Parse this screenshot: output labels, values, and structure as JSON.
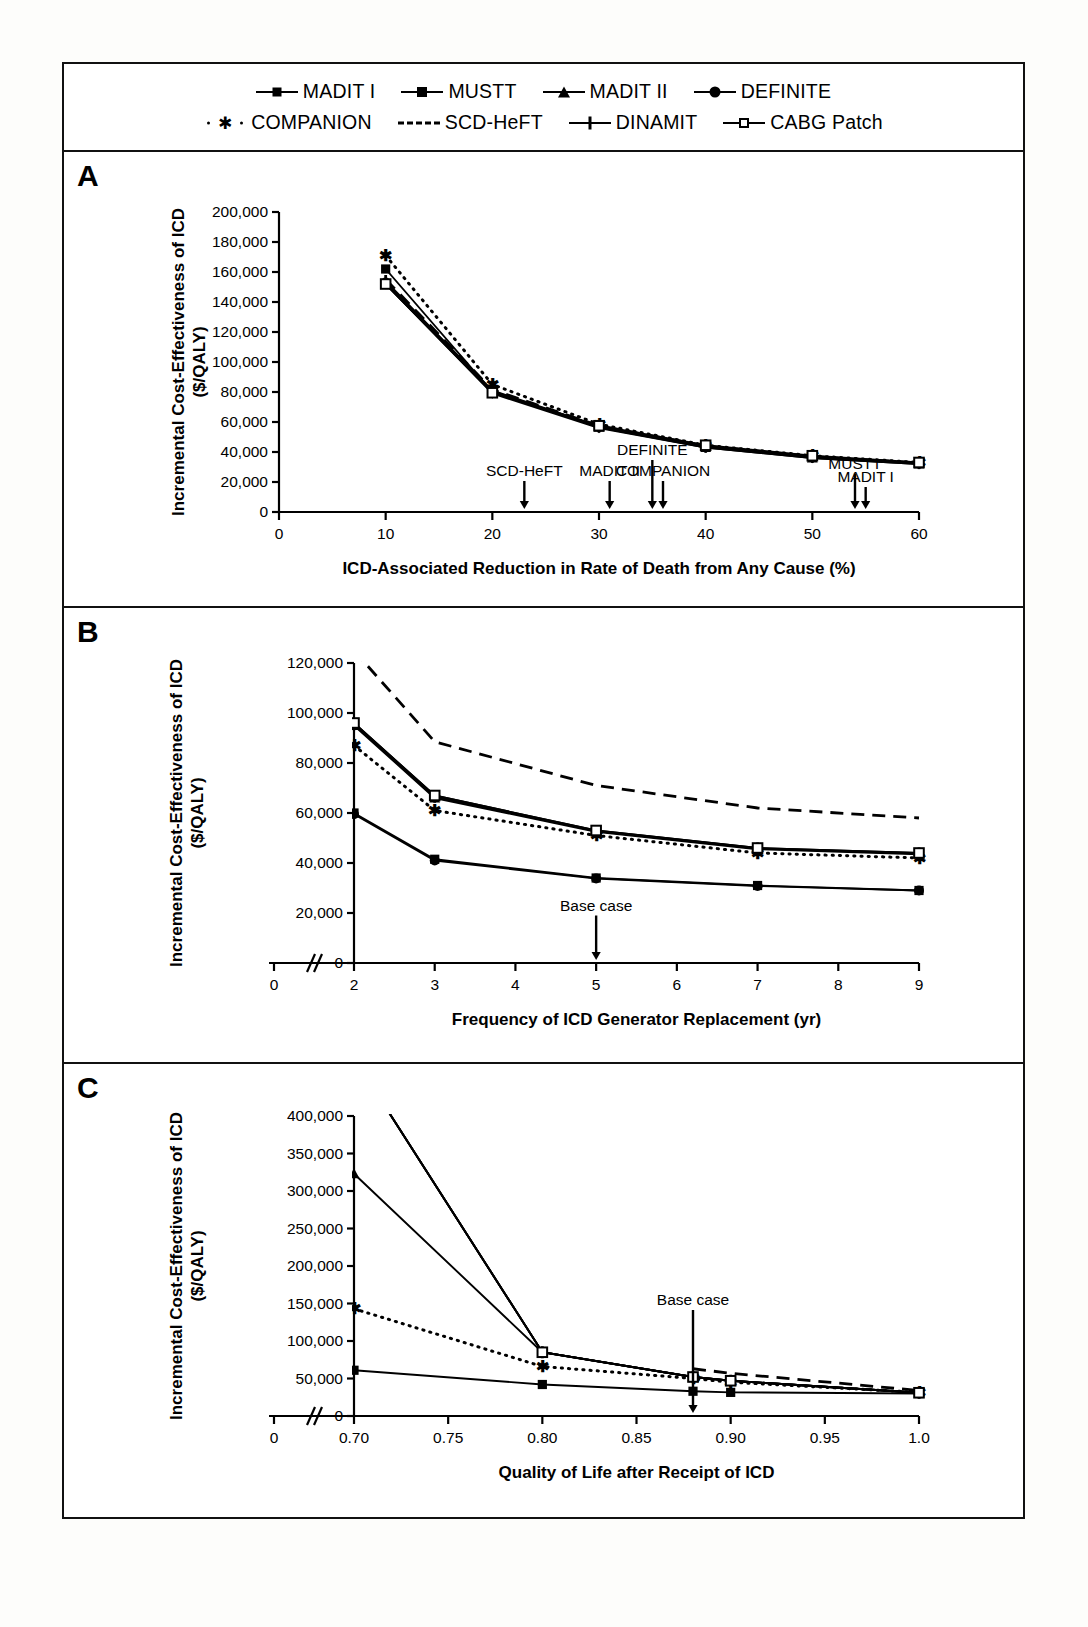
{
  "legend": {
    "rows": [
      [
        {
          "label": "MADIT I",
          "marker": "diamond",
          "line": "solid"
        },
        {
          "label": "MUSTT",
          "marker": "square",
          "line": "solid"
        },
        {
          "label": "MADIT II",
          "marker": "triangle",
          "line": "solid"
        },
        {
          "label": "DEFINITE",
          "marker": "circle",
          "line": "solid"
        }
      ],
      [
        {
          "label": "COMPANION",
          "marker": "asterisk",
          "line": "dotted"
        },
        {
          "label": "SCD-HeFT",
          "marker": "none",
          "line": "dashed"
        },
        {
          "label": "DINAMIT",
          "marker": "plus",
          "line": "solid"
        },
        {
          "label": "CABG Patch",
          "marker": "open-square",
          "line": "solid"
        }
      ]
    ]
  },
  "panels": [
    {
      "label": "A"
    },
    {
      "label": "B"
    },
    {
      "label": "C"
    }
  ],
  "chart_data": [
    {
      "panel": "A",
      "type": "line",
      "title": "",
      "xlabel": "ICD-Associated Reduction in Rate of Death from Any Cause (%)",
      "ylabel": "Incremental Cost-Effectiveness of ICD ($/QALY)",
      "ylabel_line1": "Incremental Cost-Effectiveness of ICD",
      "ylabel_line2": "($/QALY)",
      "xlim": [
        0,
        60
      ],
      "ylim": [
        0,
        200000
      ],
      "xticks": [
        0,
        10,
        20,
        30,
        40,
        50,
        60
      ],
      "xticklabels": [
        "0",
        "10",
        "20",
        "30",
        "40",
        "50",
        "60"
      ],
      "yticks": [
        0,
        20000,
        40000,
        60000,
        80000,
        100000,
        120000,
        140000,
        160000,
        180000,
        200000
      ],
      "yticklabels": [
        "0",
        "20,000",
        "40,000",
        "60,000",
        "80,000",
        "100,000",
        "120,000",
        "140,000",
        "160,000",
        "180,000",
        "200,000"
      ],
      "grid": false,
      "legend_position": "top",
      "x": [
        10,
        20,
        30,
        40,
        50,
        60
      ],
      "series": [
        {
          "name": "MADIT I",
          "marker": "diamond",
          "line": "solid",
          "values": [
            152000,
            79000,
            56000,
            43000,
            36000,
            32000
          ]
        },
        {
          "name": "MUSTT",
          "marker": "square",
          "line": "solid",
          "values": [
            162000,
            80000,
            57000,
            43500,
            36500,
            32500
          ]
        },
        {
          "name": "MADIT II",
          "marker": "triangle",
          "line": "solid",
          "values": [
            152000,
            80000,
            56500,
            43000,
            36000,
            32000
          ]
        },
        {
          "name": "DEFINITE",
          "marker": "circle",
          "line": "solid",
          "values": [
            153000,
            81000,
            57000,
            43500,
            36500,
            32500
          ]
        },
        {
          "name": "COMPANION",
          "marker": "asterisk",
          "line": "dotted",
          "values": [
            171000,
            85000,
            58500,
            44500,
            37500,
            33000
          ]
        },
        {
          "name": "SCD-HeFT",
          "marker": "none",
          "line": "dashed",
          "values": [
            155000,
            81500,
            57500,
            44000,
            37000,
            32800
          ]
        },
        {
          "name": "DINAMIT",
          "marker": "plus",
          "line": "solid",
          "values": [
            154000,
            80500,
            57000,
            43500,
            36800,
            32600
          ]
        },
        {
          "name": "CABG Patch",
          "marker": "open-square",
          "line": "solid",
          "values": [
            152000,
            79500,
            57500,
            44500,
            37500,
            33000
          ]
        }
      ],
      "annotations": [
        {
          "text": "SCD-HeFT",
          "x": 23,
          "label_y": 24000
        },
        {
          "text": "MADIT II",
          "x": 31,
          "label_y": 24000
        },
        {
          "text": "DEFINITE",
          "x": 35,
          "label_y": 38000
        },
        {
          "text": "COMPANION",
          "x": 36,
          "label_y": 24000
        },
        {
          "text": "MUSTT",
          "x": 54,
          "label_y": 29000
        },
        {
          "text": "MADIT I",
          "x": 55,
          "label_y": 20000
        }
      ]
    },
    {
      "panel": "B",
      "type": "line",
      "title": "",
      "xlabel": "Frequency of ICD Generator Replacement (yr)",
      "ylabel": "Incremental Cost-Effectiveness of ICD ($/QALY)",
      "ylabel_line1": "Incremental Cost-Effectiveness of ICD",
      "ylabel_line2": "($/QALY)",
      "xlim": [
        2,
        9
      ],
      "ylim": [
        0,
        120000
      ],
      "axis_break_x": true,
      "xticks": [
        0,
        2,
        3,
        4,
        5,
        6,
        7,
        8,
        9
      ],
      "xticklabels": [
        "0",
        "2",
        "3",
        "4",
        "5",
        "6",
        "7",
        "8",
        "9"
      ],
      "yticks": [
        0,
        20000,
        40000,
        60000,
        80000,
        100000,
        120000
      ],
      "yticklabels": [
        "0",
        "20,000",
        "40,000",
        "60,000",
        "80,000",
        "100,000",
        "120,000"
      ],
      "grid": false,
      "legend_position": "top",
      "x": [
        2,
        3,
        5,
        7,
        9
      ],
      "series": [
        {
          "name": "MADIT I",
          "marker": "diamond",
          "line": "solid",
          "values": [
            96000,
            67000,
            53000,
            46000,
            44000
          ]
        },
        {
          "name": "MUSTT",
          "marker": "square",
          "line": "solid",
          "values": [
            60000,
            41500,
            34000,
            31000,
            29000
          ]
        },
        {
          "name": "MADIT II",
          "marker": "triangle",
          "line": "solid",
          "values": [
            95000,
            66000,
            52500,
            45500,
            43500
          ]
        },
        {
          "name": "DEFINITE",
          "marker": "circle",
          "line": "solid",
          "values": [
            59500,
            41000,
            33800,
            30800,
            29000
          ]
        },
        {
          "name": "COMPANION",
          "marker": "asterisk",
          "line": "dotted",
          "values": [
            87000,
            61000,
            51000,
            44000,
            42000
          ]
        },
        {
          "name": "SCD-HeFT",
          "marker": "none",
          "line": "dashed",
          "values": [
            125000,
            88500,
            71000,
            62000,
            58000
          ]
        },
        {
          "name": "DINAMIT",
          "marker": "plus",
          "line": "solid",
          "values": [
            95500,
            66500,
            52800,
            45800,
            43800
          ]
        },
        {
          "name": "CABG Patch",
          "marker": "open-square",
          "line": "solid",
          "values": [
            96000,
            67000,
            53000,
            46000,
            44000
          ]
        }
      ],
      "annotations": [
        {
          "text": "Base case",
          "x": 5,
          "label_y": 21000
        }
      ]
    },
    {
      "panel": "C",
      "type": "line",
      "title": "",
      "xlabel": "Quality of Life after Receipt of ICD",
      "ylabel": "Incremental Cost-Effectiveness of ICD ($/QALY)",
      "ylabel_line1": "Incremental Cost-Effectiveness of ICD",
      "ylabel_line2": "($/QALY)",
      "xlim": [
        0.7,
        1.0
      ],
      "ylim": [
        0,
        400000
      ],
      "axis_break_x": true,
      "xticks": [
        0,
        0.7,
        0.75,
        0.8,
        0.85,
        0.9,
        0.95,
        1.0
      ],
      "xticklabels": [
        "0",
        "0.70",
        "0.75",
        "0.80",
        "0.85",
        "0.90",
        "0.95",
        "1.0"
      ],
      "yticks": [
        0,
        50000,
        100000,
        150000,
        200000,
        250000,
        300000,
        350000,
        400000
      ],
      "yticklabels": [
        "0",
        "50,000",
        "100,000",
        "150,000",
        "200,000",
        "250,000",
        "300,000",
        "350,000",
        "400,000"
      ],
      "grid": false,
      "legend_position": "top",
      "x": [
        0.7,
        0.8,
        0.88,
        0.9,
        1.0
      ],
      "series": [
        {
          "name": "MADIT I",
          "marker": "diamond",
          "line": "solid",
          "values": [
            null,
            85000,
            52000,
            47000,
            31000
          ]
        },
        {
          "name": "MUSTT",
          "marker": "square",
          "line": "solid",
          "values": [
            61000,
            42000,
            33000,
            31500,
            30000
          ]
        },
        {
          "name": "MADIT II",
          "marker": "triangle",
          "line": "solid",
          "values": [
            323000,
            85000,
            52000,
            47000,
            31000
          ]
        },
        {
          "name": "DEFINITE",
          "marker": "circle",
          "line": "solid",
          "values": [
            null,
            85000,
            52000,
            47000,
            31000
          ]
        },
        {
          "name": "COMPANION",
          "marker": "asterisk",
          "line": "dotted",
          "values": [
            143000,
            66000,
            50000,
            45000,
            31500
          ]
        },
        {
          "name": "SCD-HeFT",
          "marker": "none",
          "line": "dashed",
          "values": [
            null,
            null,
            63000,
            57000,
            34000
          ]
        },
        {
          "name": "DINAMIT",
          "marker": "plus",
          "line": "solid",
          "values": [
            null,
            85000,
            52000,
            47000,
            31000
          ]
        },
        {
          "name": "CABG Patch",
          "marker": "open-square",
          "line": "solid",
          "values": [
            null,
            85000,
            52000,
            47000,
            31000
          ]
        }
      ],
      "annotations": [
        {
          "text": "Base case",
          "x": 0.88,
          "label_y": 148000
        }
      ]
    }
  ]
}
